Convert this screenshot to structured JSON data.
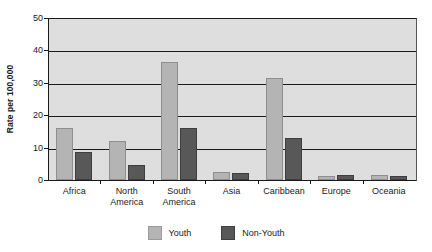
{
  "chart_data": {
    "type": "bar",
    "title": "",
    "subtitle": "",
    "xlabel": "",
    "ylabel": "Rate per 100,000",
    "ylim": [
      0,
      50
    ],
    "yticks": [
      0,
      10,
      20,
      30,
      40,
      50
    ],
    "ytick_labels": [
      "0",
      "10",
      "20",
      "30",
      "40",
      "50"
    ],
    "grid": true,
    "grid_axis": "y",
    "legend_position": "bottom-center",
    "categories": [
      "Africa",
      "North America",
      "South America",
      "Asia",
      "Caribbean",
      "Europe",
      "Oceania"
    ],
    "category_lines": [
      [
        "Africa"
      ],
      [
        "North",
        "America"
      ],
      [
        "South",
        "America"
      ],
      [
        "Asia"
      ],
      [
        "Caribbean"
      ],
      [
        "Europe"
      ],
      [
        "Oceania"
      ]
    ],
    "series": [
      {
        "name": "Youth",
        "color": "#b4b4b4",
        "values": [
          16.1,
          12.0,
          36.3,
          2.5,
          31.5,
          1.2,
          1.4
        ]
      },
      {
        "name": "Non-Youth",
        "color": "#585858",
        "values": [
          8.7,
          4.5,
          16.0,
          2.1,
          13.1,
          1.4,
          1.2
        ]
      }
    ]
  },
  "legend": {
    "entries": [
      {
        "label": "Youth"
      },
      {
        "label": "Non-Youth"
      }
    ]
  },
  "colors": {
    "plot_background": "#dedede",
    "page_background": "#ffffff",
    "axis": "#1a1a1a",
    "youth": "#b4b4b4",
    "non_youth": "#585858"
  }
}
